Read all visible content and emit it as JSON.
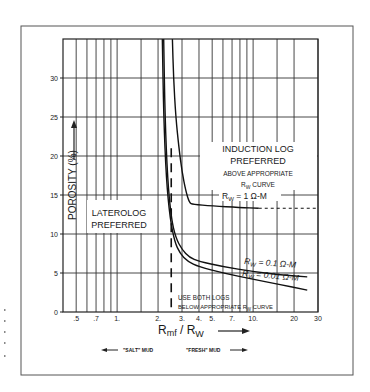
{
  "chart_data": {
    "type": "line",
    "title": "",
    "xlabel": "Rmf / Rw",
    "xlabel_main": "R",
    "xlabel_sub1": "mf",
    "xlabel_sep": " / R",
    "xlabel_sub2": "W",
    "ylabel": "POROSITY (%)",
    "xscale": "log",
    "xlim": [
      0.4,
      30
    ],
    "ylim": [
      0,
      35
    ],
    "grid": true,
    "x_ticks": [
      {
        "value": 0.5,
        "label": ".5"
      },
      {
        "value": 0.7,
        "label": ".7"
      },
      {
        "value": 1,
        "label": "1."
      },
      {
        "value": 2,
        "label": "2."
      },
      {
        "value": 3,
        "label": "3."
      },
      {
        "value": 4,
        "label": "4."
      },
      {
        "value": 5,
        "label": "5."
      },
      {
        "value": 7,
        "label": "7."
      },
      {
        "value": 10,
        "label": "10."
      },
      {
        "value": 20,
        "label": "20"
      },
      {
        "value": 30,
        "label": "30"
      }
    ],
    "y_ticks": [
      {
        "value": 0,
        "label": "0"
      },
      {
        "value": 5,
        "label": "5"
      },
      {
        "value": 10,
        "label": "10"
      },
      {
        "value": 15,
        "label": "15"
      },
      {
        "value": 20,
        "label": "20"
      },
      {
        "value": 25,
        "label": "25"
      },
      {
        "value": 30,
        "label": "30"
      }
    ],
    "x_gridlines": [
      0.5,
      0.6,
      0.7,
      0.8,
      0.9,
      1,
      1.5,
      2,
      3,
      4,
      5,
      6,
      7,
      8,
      9,
      10,
      15,
      20,
      30
    ],
    "y_gridlines": [
      5,
      10,
      15,
      20,
      25,
      30
    ],
    "series": [
      {
        "name": "Rw = 1 Ω-M",
        "label_main": "R",
        "label_sub": "W",
        "label_rest": " = 1 Ω-M",
        "x": [
          2.55,
          2.6,
          2.7,
          2.85,
          3.0,
          3.2,
          3.4,
          3.6,
          5,
          8,
          11
        ],
        "y": [
          35,
          30,
          25,
          21,
          18,
          15.5,
          14,
          13.8,
          13.6,
          13.4,
          13.3
        ],
        "extension": {
          "style": "dashed",
          "x": [
            11,
            30
          ],
          "y": [
            13.3,
            13.3
          ]
        }
      },
      {
        "name": "Rw = 0.1 Ω-M",
        "label_main": "R",
        "label_sub": "W",
        "label_rest": " = 0.1 Ω-M",
        "x": [
          2.2,
          2.25,
          2.35,
          2.5,
          2.7,
          3.0,
          3.4,
          4,
          6,
          10,
          15,
          25
        ],
        "y": [
          35,
          25,
          17,
          12,
          9.5,
          8,
          7,
          6.5,
          5.8,
          5.2,
          4.8,
          4.5
        ]
      },
      {
        "name": "Rw = 0.01 Ω-M",
        "label_main": "R",
        "label_sub": "W",
        "label_rest": " = 0.01 Ω-M",
        "x": [
          2.15,
          2.2,
          2.3,
          2.45,
          2.65,
          2.9,
          3.3,
          4,
          6,
          10,
          15,
          25
        ],
        "y": [
          35,
          25,
          17,
          12,
          9,
          7.5,
          6.5,
          5.8,
          5,
          4.2,
          3.6,
          2.8
        ]
      }
    ],
    "reference_line": {
      "style": "dashed",
      "x": 2.5,
      "y_range": [
        0,
        21
      ]
    },
    "annotations": {
      "induction": {
        "line1": "INDUCTION LOG",
        "line2": "PREFERRED",
        "line3": "ABOVE APPROPRIATE",
        "line4_main": "R",
        "line4_sub": "W",
        "line4_rest": " CURVE"
      },
      "laterolog": {
        "line1": "LATEROLOG",
        "line2": "PREFERRED"
      },
      "both": {
        "line1": "USE BOTH LOGS",
        "line2_pre": "BELOW APPROPRIATE  ",
        "line2_main": "R",
        "line2_sub": "W",
        "line2_rest": " CURVE"
      },
      "salt_mud": "\"SALT\" MUD",
      "fresh_mud": "\"FRESH\" MUD"
    }
  }
}
